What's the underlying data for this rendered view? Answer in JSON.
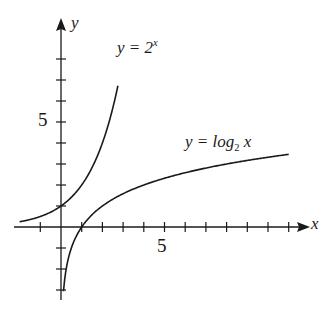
{
  "chart_data": {
    "type": "line",
    "title": "",
    "xlabel": "x",
    "ylabel": "y",
    "xlim": [
      -2,
      12
    ],
    "ylim": [
      -4,
      10
    ],
    "grid": false,
    "legend": "inline labels",
    "x_tick_labels": [
      {
        "value": 5,
        "label": "5"
      }
    ],
    "y_tick_labels": [
      {
        "value": 5,
        "label": "5"
      }
    ],
    "x_ticks": [
      -1,
      1,
      2,
      3,
      4,
      5,
      6,
      7,
      8,
      9,
      10,
      11
    ],
    "y_ticks": [
      -3,
      -2,
      -1,
      1,
      2,
      3,
      4,
      5,
      6,
      7,
      8
    ],
    "series": [
      {
        "name": "y = 2^x",
        "label_text": "y = 2",
        "label_sup": "x",
        "x_range": [
          -2,
          2.75
        ],
        "function": "2^x"
      },
      {
        "name": "y = log2 x",
        "label_text": "y = log",
        "label_sub": "2",
        "label_tail": " x",
        "x_range": [
          0.12,
          11
        ],
        "function": "log2(x)"
      }
    ],
    "annotations": [
      "y = 2^x",
      "y = log2 x"
    ]
  },
  "labels": {
    "x_axis": "x",
    "y_axis": "y",
    "x_tick_5": "5",
    "y_tick_5": "5",
    "exp_main": "y = 2",
    "exp_sup": "x",
    "log_main": "y = log",
    "log_sub": "2",
    "log_tail": " x"
  },
  "colors": {
    "ink": "#1a1a1a",
    "background": "#ffffff"
  }
}
